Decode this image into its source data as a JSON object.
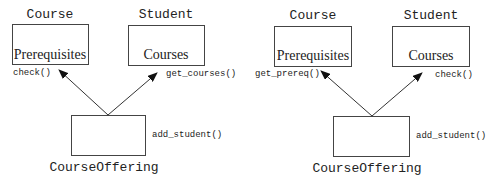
{
  "diagrams": [
    {
      "course": {
        "title": "Course",
        "attribute": "Prerequisites",
        "method": "check()"
      },
      "student": {
        "title": "Student",
        "attribute": "Courses",
        "method": "get_courses()"
      },
      "offering": {
        "title": "CourseOffering",
        "method": "add_student()"
      }
    },
    {
      "course": {
        "title": "Course",
        "attribute": "Prerequisites",
        "method": "get_prereq()"
      },
      "student": {
        "title": "Student",
        "attribute": "Courses",
        "method": "check()"
      },
      "offering": {
        "title": "CourseOffering",
        "method": "add_student()"
      }
    }
  ]
}
